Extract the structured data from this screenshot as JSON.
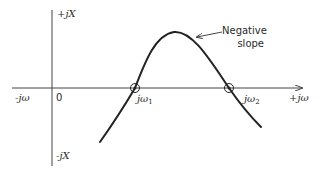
{
  "diagram": {
    "type": "reactance-vs-frequency sketch",
    "axes": {
      "vertical_top_label": "+jX",
      "vertical_bottom_label": "-jX",
      "horizontal_left_label": "-jω",
      "horizontal_right_label": "+jω",
      "origin_label": "0"
    },
    "points": [
      {
        "label_prefix": "jω",
        "label_sub": "1",
        "description": "zero crossing 1"
      },
      {
        "label_prefix": "jω",
        "label_sub": "2",
        "description": "zero crossing 2"
      }
    ],
    "annotation": {
      "line1": "Negative",
      "line2": "slope"
    },
    "colors": {
      "stroke": "#222222",
      "axis": "#444444",
      "background": "#ffffff"
    }
  }
}
